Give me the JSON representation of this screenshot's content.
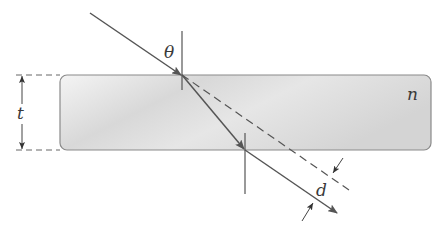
{
  "diagram": {
    "labels": {
      "angle": "θ",
      "thickness": "t",
      "index": "n",
      "displacement": "d"
    },
    "colors": {
      "line": "#555555",
      "slab_fill_light": "#f2f2f2",
      "slab_fill_dark": "#cfcfcf",
      "slab_stroke": "#8a8a8a"
    }
  }
}
